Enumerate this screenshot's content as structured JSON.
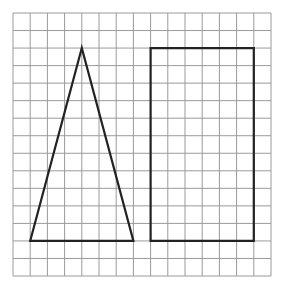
{
  "figure": {
    "grid": {
      "cols": 15,
      "rows": 15,
      "x0": 13,
      "y0": 13,
      "x1": 271,
      "y1": 276,
      "line_color": "#9a9a9a"
    },
    "shapes": [
      {
        "name": "triangle",
        "points_grid": [
          [
            1,
            13
          ],
          [
            4,
            2
          ],
          [
            7,
            13
          ]
        ],
        "stroke": "#222222"
      },
      {
        "name": "rectangle",
        "points_grid": [
          [
            8,
            2
          ],
          [
            14,
            2
          ],
          [
            14,
            13
          ],
          [
            8,
            13
          ]
        ],
        "stroke": "#222222"
      }
    ]
  }
}
